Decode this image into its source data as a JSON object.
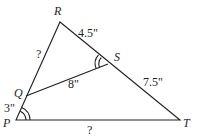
{
  "diagram": {
    "type": "geometry-triangle",
    "points": {
      "P": {
        "label": "P",
        "x": 16,
        "y": 120
      },
      "Q": {
        "label": "Q",
        "x": 26,
        "y": 96
      },
      "R": {
        "label": "R",
        "x": 60,
        "y": 22
      },
      "S": {
        "label": "S",
        "x": 108,
        "y": 64
      },
      "T": {
        "label": "T",
        "x": 180,
        "y": 120
      }
    },
    "segments": {
      "RS": "4.5\"",
      "ST": "7.5\"",
      "QS": "8\"",
      "PQ": "3\"",
      "RQ": "?",
      "PT": "?"
    },
    "angle_marks": [
      "angle-P-double-arc",
      "angle-QSR-double-arc"
    ],
    "line_color": "#231f20"
  }
}
